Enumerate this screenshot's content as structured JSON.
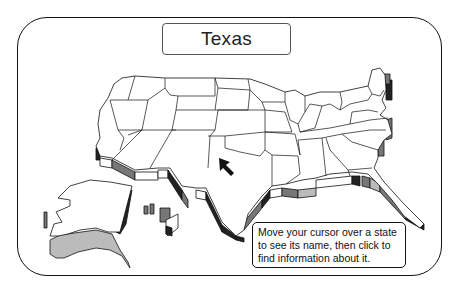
{
  "header": {
    "state_name": "Texas"
  },
  "instructions": {
    "text": "Move your cursor over a state to see its name, then click to find information about it."
  },
  "map": {
    "hovered_state": "Texas",
    "states_visible": [
      "Alaska",
      "Hawaii",
      "Contiguous United States"
    ],
    "colors": {
      "outline": "#111111",
      "fill": "#ffffff",
      "extrusion_dark": "#222222",
      "extrusion_mid": "#777777",
      "extrusion_light": "#bbbbbb"
    }
  },
  "cursor": {
    "icon": "arrow-cursor-icon"
  }
}
